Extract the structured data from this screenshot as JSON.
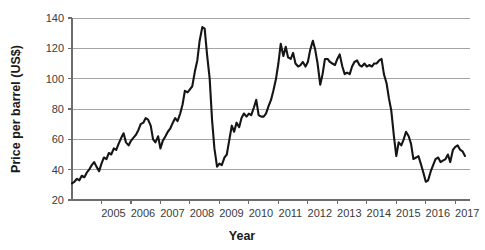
{
  "chart_data": {
    "type": "line",
    "title": "",
    "xlabel": "Year",
    "ylabel": "Price per barrel (US$)",
    "ylim": [
      20,
      140
    ],
    "yticks": [
      20,
      40,
      60,
      80,
      100,
      120,
      140
    ],
    "ytick_labels": [
      "20",
      "40",
      "60",
      "80",
      "100",
      "120",
      "140"
    ],
    "xlim": [
      2004.0,
      2017.5
    ],
    "xticks": [
      2005,
      2006,
      2007,
      2008,
      2009,
      2010,
      2011,
      2012,
      2013,
      2014,
      2015,
      2016,
      2017
    ],
    "xtick_labels": [
      "2005",
      "2006",
      "2007",
      "2008",
      "2009",
      "2010",
      "2011",
      "2012",
      "2013",
      "2014",
      "2015",
      "2016",
      "2017"
    ],
    "grid": true,
    "legend": false,
    "line_color": "#151515",
    "grid_color": "#9a9a9a",
    "axis_color": "#6d6d6d",
    "series": [
      {
        "name": "Crude oil price",
        "x": [
          2004.0,
          2004.08,
          2004.17,
          2004.25,
          2004.33,
          2004.42,
          2004.5,
          2004.58,
          2004.67,
          2004.75,
          2004.83,
          2004.92,
          2005.0,
          2005.08,
          2005.17,
          2005.25,
          2005.33,
          2005.42,
          2005.5,
          2005.58,
          2005.67,
          2005.75,
          2005.83,
          2005.92,
          2006.0,
          2006.08,
          2006.17,
          2006.25,
          2006.33,
          2006.42,
          2006.5,
          2006.58,
          2006.67,
          2006.75,
          2006.83,
          2006.92,
          2007.0,
          2007.08,
          2007.17,
          2007.25,
          2007.33,
          2007.42,
          2007.5,
          2007.58,
          2007.67,
          2007.75,
          2007.83,
          2007.92,
          2008.0,
          2008.08,
          2008.17,
          2008.25,
          2008.33,
          2008.42,
          2008.5,
          2008.58,
          2008.67,
          2008.75,
          2008.83,
          2008.92,
          2009.0,
          2009.08,
          2009.17,
          2009.25,
          2009.33,
          2009.42,
          2009.5,
          2009.58,
          2009.67,
          2009.75,
          2009.83,
          2009.92,
          2010.0,
          2010.08,
          2010.17,
          2010.25,
          2010.33,
          2010.42,
          2010.5,
          2010.58,
          2010.67,
          2010.75,
          2010.83,
          2010.92,
          2011.0,
          2011.08,
          2011.17,
          2011.25,
          2011.33,
          2011.42,
          2011.5,
          2011.58,
          2011.67,
          2011.75,
          2011.83,
          2011.92,
          2012.0,
          2012.08,
          2012.17,
          2012.25,
          2012.33,
          2012.42,
          2012.5,
          2012.58,
          2012.67,
          2012.75,
          2012.83,
          2012.92,
          2013.0,
          2013.08,
          2013.17,
          2013.25,
          2013.33,
          2013.42,
          2013.5,
          2013.58,
          2013.67,
          2013.75,
          2013.83,
          2013.92,
          2014.0,
          2014.08,
          2014.17,
          2014.25,
          2014.33,
          2014.42,
          2014.5,
          2014.58,
          2014.67,
          2014.75,
          2014.83,
          2014.92,
          2015.0,
          2015.08,
          2015.17,
          2015.25,
          2015.33,
          2015.42,
          2015.5,
          2015.58,
          2015.67,
          2015.75,
          2015.83,
          2015.92,
          2016.0,
          2016.08,
          2016.17,
          2016.25,
          2016.33,
          2016.42,
          2016.5,
          2016.58,
          2016.67,
          2016.75,
          2016.83,
          2016.92,
          2017.0,
          2017.08,
          2017.17,
          2017.25,
          2017.33
        ],
        "values": [
          31,
          32,
          34,
          33,
          36,
          35,
          38,
          40,
          43,
          45,
          42,
          39,
          44,
          48,
          47,
          51,
          50,
          54,
          53,
          57,
          61,
          64,
          58,
          56,
          59,
          61,
          63,
          66,
          70,
          71,
          74,
          73,
          69,
          60,
          58,
          62,
          54,
          59,
          62,
          65,
          67,
          71,
          74,
          72,
          77,
          83,
          92,
          91,
          93,
          95,
          105,
          112,
          125,
          134,
          133,
          116,
          100,
          73,
          54,
          42,
          44,
          43,
          48,
          50,
          59,
          69,
          65,
          71,
          68,
          74,
          77,
          75,
          77,
          76,
          81,
          86,
          76,
          75,
          75,
          77,
          82,
          86,
          92,
          100,
          110,
          123,
          115,
          121,
          114,
          113,
          117,
          110,
          108,
          109,
          111,
          108,
          111,
          119,
          125,
          119,
          110,
          96,
          103,
          113,
          113,
          111,
          110,
          109,
          113,
          116,
          108,
          103,
          104,
          103,
          108,
          111,
          112,
          109,
          108,
          110,
          108,
          109,
          108,
          110,
          110,
          112,
          113,
          103,
          97,
          87,
          79,
          62,
          49,
          58,
          56,
          60,
          65,
          62,
          57,
          47,
          48,
          49,
          44,
          38,
          32,
          33,
          39,
          43,
          47,
          48,
          45,
          46,
          47,
          50,
          45,
          53,
          55,
          56,
          53,
          52,
          49
        ]
      }
    ]
  },
  "axes": {
    "x_title": "Year",
    "y_title": "Price per barrel (US$)"
  }
}
